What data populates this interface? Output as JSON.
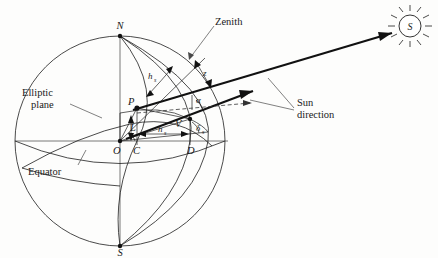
{
  "figure": {
    "background_color": "#fdfdfc",
    "line_color": "#1d1d1d"
  },
  "labels": {
    "north_pole": "N",
    "south_pole": "S",
    "center": "O",
    "point_p": "P",
    "point_c": "C",
    "point_d": "D",
    "point_v": "V",
    "sun_letter": "S",
    "latitude": "L",
    "altitude_angle": "α",
    "zenith_angle": "z",
    "hour_angle_arc": "h",
    "hour_angle_arc_sub": "s",
    "hour_angle_linear": "h",
    "hour_angle_linear_sub": "s",
    "declination": "δ",
    "declination_sub": "s",
    "zenith": "Zenith",
    "elliptic_plane_line1": "Elliptic",
    "elliptic_plane_line2": "plane",
    "equator": "Equator",
    "sun_direction_line1": "Sun",
    "sun_direction_line2": "direction"
  },
  "geometry": {
    "sphere_center": {
      "x": 120,
      "y": 141
    },
    "sphere_radius": 105,
    "north_pole_point": {
      "x": 120,
      "y": 36
    },
    "south_pole_point": {
      "x": 120,
      "y": 246
    },
    "point_p": {
      "x": 137,
      "y": 108
    },
    "point_v": {
      "x": 190,
      "y": 119
    },
    "point_c": {
      "x": 137,
      "y": 141
    },
    "point_d": {
      "x": 190,
      "y": 141
    },
    "sun_symbol_center": {
      "x": 410,
      "y": 26
    },
    "sun_symbol_radius": 11
  }
}
